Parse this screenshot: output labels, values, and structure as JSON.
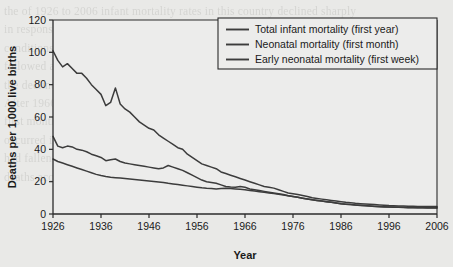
{
  "figure": {
    "background_color": "#e9e9e7",
    "plot_background_color": "#ececeb",
    "axis_color": "#2b2b2b",
    "series_color": "#3c3c3c"
  },
  "ghost_text": "the of 1926 to 2006 infant mortality rates in this country declined sharply\nin response to improved public health measures and general living\nconditions. The neonatal mortality rate and the early neonatal rate\nfollowed a similar downward trajectory over the same period, although\nthe decline in neonatal mortality was more gradual in the postwar years.\nAfter 1966 the three curves began to converge as deaths beyond the\nfirst month became comparatively rare and the bulk of infant deaths\noccurred in the first week of life. By 2006 the total infant mortality rate\nhad fallen below 5 deaths per 1,000 live births, with early neonatal\ndeaths accounting for the majority of that residual figure.",
  "chart_data": {
    "type": "line",
    "title": "",
    "xlabel": "Year",
    "ylabel": "Deaths per 1,000 live births",
    "xlim": [
      1926,
      2006
    ],
    "ylim": [
      0,
      120
    ],
    "ytick_values": [
      0,
      20,
      40,
      60,
      80,
      100,
      120
    ],
    "ytick_labels": [
      "0",
      "20",
      "40",
      "60",
      "80",
      "100",
      "120"
    ],
    "xtick_values": [
      1926,
      1936,
      1946,
      1956,
      1966,
      1976,
      1986,
      1996,
      2006
    ],
    "xtick_labels": [
      "1926",
      "1936",
      "1946",
      "1956",
      "1966",
      "1976",
      "1986",
      "1996",
      "2006"
    ],
    "grid": false,
    "legend_position": "top-right",
    "x": [
      1926,
      1927,
      1928,
      1929,
      1930,
      1931,
      1932,
      1933,
      1934,
      1935,
      1936,
      1937,
      1938,
      1939,
      1940,
      1941,
      1942,
      1943,
      1944,
      1945,
      1946,
      1947,
      1948,
      1949,
      1950,
      1951,
      1952,
      1953,
      1954,
      1955,
      1956,
      1957,
      1958,
      1959,
      1960,
      1961,
      1962,
      1963,
      1964,
      1965,
      1966,
      1967,
      1968,
      1969,
      1970,
      1971,
      1972,
      1973,
      1974,
      1975,
      1976,
      1977,
      1978,
      1979,
      1980,
      1981,
      1982,
      1983,
      1984,
      1985,
      1986,
      1987,
      1988,
      1989,
      1990,
      1991,
      1992,
      1993,
      1994,
      1995,
      1996,
      1997,
      1998,
      1999,
      2000,
      2001,
      2002,
      2003,
      2004,
      2005,
      2006
    ],
    "series": [
      {
        "name": "Total infant mortality (first year)",
        "legend_label": "Total infant mortality (first year)",
        "values": [
          101,
          95,
          91,
          93,
          90,
          87,
          87,
          84,
          80,
          77,
          74,
          67,
          69,
          78,
          68,
          65,
          63,
          60,
          57,
          55,
          53,
          52,
          49,
          47,
          45,
          43,
          41,
          40,
          37,
          35,
          33,
          31,
          30,
          29,
          28,
          26,
          25,
          24,
          23,
          22,
          21,
          20,
          19,
          18,
          17,
          16.5,
          16,
          15,
          14,
          13,
          12.5,
          12,
          11.4,
          10.8,
          10,
          9.6,
          9.2,
          8.8,
          8.4,
          8,
          7.6,
          7.2,
          6.9,
          6.6,
          6.4,
          6.2,
          6,
          5.8,
          5.6,
          5.4,
          5.2,
          5.1,
          5,
          4.9,
          4.8,
          4.8,
          4.7,
          4.7,
          4.6,
          4.6,
          4.6
        ]
      },
      {
        "name": "Neonatal mortality (first month)",
        "legend_label": "Neonatal mortality (first month)",
        "values": [
          48,
          42,
          41,
          42,
          41.5,
          40,
          39.5,
          38.5,
          37,
          36,
          35,
          33,
          33.5,
          34,
          32.5,
          31.5,
          31,
          30.5,
          30,
          29.5,
          29,
          28.5,
          28,
          28.5,
          30,
          29,
          28,
          27,
          25.5,
          24,
          22.5,
          21,
          20,
          19.5,
          19,
          18,
          17,
          16.7,
          16.5,
          17,
          16.5,
          15.5,
          15,
          14.5,
          14,
          13.5,
          13,
          12.5,
          12,
          11.3,
          10.8,
          10.3,
          9.8,
          9.3,
          8.8,
          8.4,
          8,
          7.6,
          7.2,
          6.8,
          6.4,
          6.1,
          5.8,
          5.6,
          5.4,
          5.2,
          5,
          4.8,
          4.6,
          4.5,
          4.4,
          4.3,
          4.2,
          4.1,
          4,
          4,
          3.9,
          3.9,
          3.8,
          3.8,
          3.8
        ]
      },
      {
        "name": "Early neonatal mortality (first week)",
        "legend_label": "Early neonatal mortality (first week)",
        "values": [
          34,
          32.5,
          31.5,
          30.5,
          29.5,
          28.5,
          27.5,
          26.5,
          25.5,
          24.5,
          23.8,
          23.2,
          22.8,
          22.5,
          22.2,
          21.9,
          21.6,
          21.3,
          21,
          20.7,
          20.4,
          20.1,
          19.8,
          19.5,
          19,
          18.6,
          18.2,
          17.8,
          17.4,
          17,
          16.6,
          16.2,
          15.9,
          15.7,
          15.5,
          15.7,
          15.9,
          15.7,
          15.5,
          15.3,
          15,
          14.6,
          14.2,
          13.8,
          13.4,
          13,
          12.6,
          12.2,
          11.8,
          11.3,
          10.8,
          10.3,
          9.8,
          9.3,
          8.8,
          8.4,
          8,
          7.6,
          7.2,
          6.8,
          6.4,
          6.1,
          5.8,
          5.5,
          5.3,
          5.1,
          4.9,
          4.7,
          4.5,
          4.4,
          4.3,
          4.2,
          4.1,
          4,
          3.9,
          3.9,
          3.8,
          3.8,
          3.7,
          3.7,
          3.7
        ]
      }
    ]
  }
}
